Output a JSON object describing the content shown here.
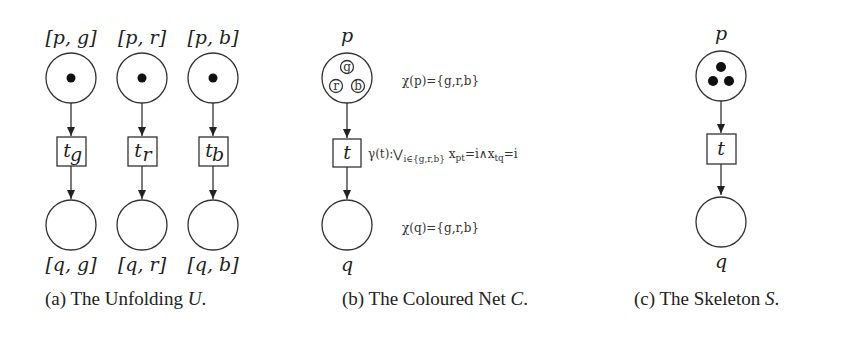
{
  "figure": {
    "panels": [
      {
        "id": "a",
        "caption_prefix": "(a) The Unfolding ",
        "caption_symbol": "U",
        "caption_suffix": ".",
        "columns": [
          {
            "top_place": "[p, g]",
            "transition_base": "t",
            "transition_sub": "g",
            "bottom_place": "[q, g]"
          },
          {
            "top_place": "[p, r]",
            "transition_base": "t",
            "transition_sub": "r",
            "bottom_place": "[q, r]"
          },
          {
            "top_place": "[p, b]",
            "transition_base": "t",
            "transition_sub": "b",
            "bottom_place": "[q, b]"
          }
        ]
      },
      {
        "id": "b",
        "caption_prefix": "(b) The Coloured Net ",
        "caption_symbol": "C",
        "caption_suffix": ".",
        "top_place": "p",
        "transition": "t",
        "bottom_place": "q",
        "tokens": [
          "g",
          "r",
          "b"
        ],
        "chi_p": "χ(p)={g,r,b}",
        "guard_prefix": "γ(t):⋁",
        "guard_sub": "i∈{g,r,b}",
        "guard_expr": " x",
        "guard_x1_sub": "pt",
        "guard_mid": "=i∧x",
        "guard_x2_sub": "tq",
        "guard_end": "=i",
        "chi_q": "χ(q)={g,r,b}"
      },
      {
        "id": "c",
        "caption_prefix": "(c) The Skeleton ",
        "caption_symbol": "S",
        "caption_suffix": ".",
        "top_place": "p",
        "transition": "t",
        "bottom_place": "q",
        "token_count": 3
      }
    ]
  }
}
